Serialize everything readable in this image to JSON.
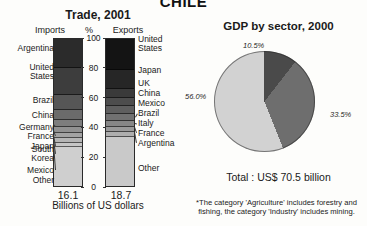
{
  "country_title": "CHILE",
  "trade": {
    "title": "Trade, 2001",
    "imports_header": "Imports",
    "percent_header": "%",
    "exports_header": "Exports",
    "imports_total": "16.1",
    "exports_total": "18.7",
    "units_label": "Billions of US dollars",
    "axis_ticks": [
      "100",
      "80",
      "60",
      "40",
      "20",
      "0"
    ],
    "imports_segments": [
      {
        "label": "Argentina",
        "value": 20.0,
        "color": "#2b2b2b"
      },
      {
        "label": "United\nStates",
        "value": 19.0,
        "color": "#3d3d3d"
      },
      {
        "label": "Brazil",
        "value": 10.5,
        "color": "#565656"
      },
      {
        "label": "China",
        "value": 6.5,
        "color": "#6b6b6b"
      },
      {
        "label": "Germany",
        "value": 4.5,
        "color": "#7d7d7d"
      },
      {
        "label": "France",
        "value": 3.5,
        "color": "#919191"
      },
      {
        "label": "Japan",
        "value": 3.0,
        "color": "#a3a3a3"
      },
      {
        "label": "South\nKorea",
        "value": 2.5,
        "color": "#b5b5b5"
      },
      {
        "label": "Mexico",
        "value": 2.5,
        "color": "#c6c6c6"
      },
      {
        "label": "Other",
        "value": 28.0,
        "color": "#cfcfcf"
      }
    ],
    "exports_segments": [
      {
        "label": "United\nStates",
        "value": 22.0,
        "color": "#141414"
      },
      {
        "label": "Japan",
        "value": 12.5,
        "color": "#262626"
      },
      {
        "label": "UK",
        "value": 6.0,
        "color": "#3a3a3a"
      },
      {
        "label": "China",
        "value": 5.5,
        "color": "#4d4d4d"
      },
      {
        "label": "Mexico",
        "value": 4.5,
        "color": "#5f5f5f"
      },
      {
        "label": "Brazil",
        "value": 4.5,
        "color": "#717171"
      },
      {
        "label": "Italy",
        "value": 3.5,
        "color": "#878787"
      },
      {
        "label": "France",
        "value": 3.0,
        "color": "#9a9a9a"
      },
      {
        "label": "Argentina",
        "value": 3.0,
        "color": "#aeaeae"
      },
      {
        "label": "Other",
        "value": 35.5,
        "color": "#c9c9c9"
      }
    ]
  },
  "gdp": {
    "title": "GDP by sector, 2000",
    "total": "Total : US$ 70.5 billion",
    "note": "*The category 'Agriculture' includes forestry and fishing, the category 'Industry' includes mining.",
    "labels": {
      "a": "10.5%",
      "b": "33.5%",
      "c": "56.0%"
    }
  },
  "chart_data": [
    {
      "type": "bar",
      "title": "Trade, 2001",
      "subtype": "stacked-percentage",
      "xlabel": "Billions of US dollars",
      "ylabel": "%",
      "ylim": [
        0,
        100
      ],
      "grid": false,
      "categories": [
        "Imports",
        "Exports"
      ],
      "category_totals_usd_billions": [
        16.1,
        18.7
      ],
      "ticks": [
        0,
        20,
        40,
        60,
        80,
        100
      ],
      "series": [
        {
          "name": "Imports",
          "partners": [
            "Argentina",
            "United States",
            "Brazil",
            "China",
            "Germany",
            "France",
            "Japan",
            "South Korea",
            "Mexico",
            "Other"
          ],
          "values": [
            20.0,
            19.0,
            10.5,
            6.5,
            4.5,
            3.5,
            3.0,
            2.5,
            2.5,
            28.0
          ]
        },
        {
          "name": "Exports",
          "partners": [
            "United States",
            "Japan",
            "UK",
            "China",
            "Mexico",
            "Brazil",
            "Italy",
            "France",
            "Argentina",
            "Other"
          ],
          "values": [
            22.0,
            12.5,
            6.0,
            5.5,
            4.5,
            4.5,
            3.5,
            3.0,
            3.0,
            35.5
          ]
        }
      ]
    },
    {
      "type": "pie",
      "title": "GDP by sector, 2000",
      "total_label": "Total : US$ 70.5 billion",
      "legend": "none",
      "slices": [
        {
          "label": "10.5%",
          "value": 10.5,
          "color": "#4a4a4a"
        },
        {
          "label": "33.5%",
          "value": 33.5,
          "color": "#6e6e6e"
        },
        {
          "label": "56.0%",
          "value": 56.0,
          "color": "#d2d2d2"
        }
      ],
      "annotation": "*The category 'Agriculture' includes forestry and fishing, the category 'Industry' includes mining."
    }
  ]
}
